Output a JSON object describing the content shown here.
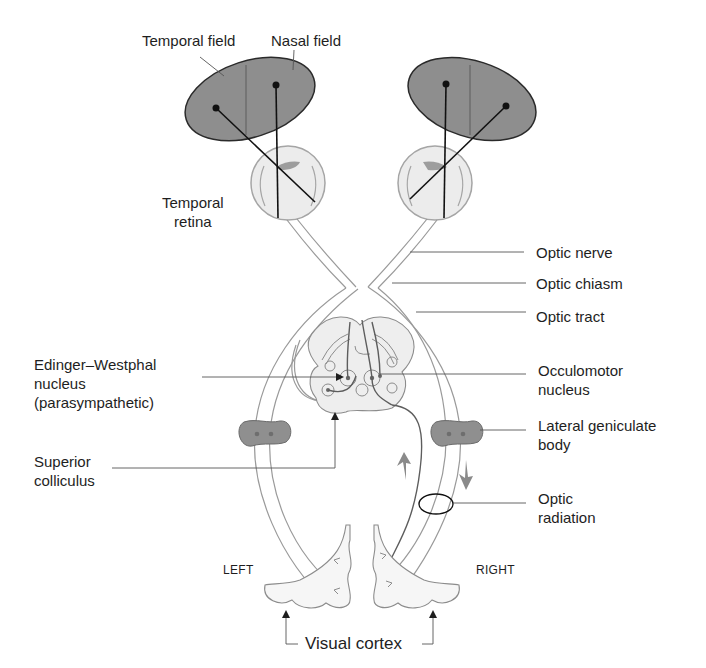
{
  "colors": {
    "background": "#ffffff",
    "field_fill": "#8e8e8e",
    "field_stroke": "#2a2a2a",
    "tract_stroke": "#9a9a9a",
    "eye_fill": "#ececec",
    "lgn_fill": "#8f8f8f",
    "midbrain_fill": "#eeeeee",
    "leader_line": "#555555",
    "text": "#1e1e1e",
    "arrow_gray": "#8a8a8a"
  },
  "labels": {
    "temporal_field": "Temporal field",
    "nasal_field": "Nasal field",
    "temporal_retina": "Temporal\nretina",
    "optic_nerve": "Optic nerve",
    "optic_chiasm": "Optic chiasm",
    "optic_tract": "Optic tract",
    "edinger_westphal": "Edinger–Westphal\nnucleus\n(parasympathetic)",
    "occulomotor": "Occulomotor\nnucleus",
    "lateral_geniculate": "Lateral geniculate\nbody",
    "superior_colliculus": "Superior\ncolliculus",
    "optic_radiation": "Optic\nradiation",
    "left": "LEFT",
    "right": "RIGHT",
    "visual_cortex": "Visual cortex"
  }
}
